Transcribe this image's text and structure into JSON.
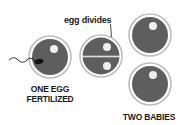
{
  "diagram": {
    "type": "identical-twins-formation",
    "colors": {
      "egg_fill": "#5e5e5e",
      "egg_ring": "#bfbfbf",
      "egg_gap": "#ffffff",
      "nucleus": "#eeeeee",
      "sperm": "#111111",
      "text": "#1a1a1a",
      "background": "#ffffff"
    },
    "stages": [
      {
        "id": "fertilized-egg",
        "label_line1": "ONE EGG",
        "label_line2": "FERTILIZED",
        "icons": [
          "egg-icon",
          "sperm-icon",
          "nucleus-icon"
        ]
      },
      {
        "id": "dividing-egg",
        "annotation": "egg divides",
        "icons": [
          "egg-icon",
          "division-line",
          "nucleus-icon",
          "nucleus-icon"
        ]
      },
      {
        "id": "two-embryos",
        "label": "TWO BABIES",
        "icons": [
          "egg-icon",
          "egg-icon"
        ]
      }
    ]
  }
}
